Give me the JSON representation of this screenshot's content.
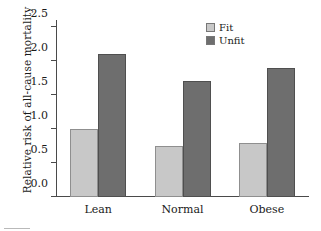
{
  "chart_data": {
    "type": "bar",
    "title": "",
    "xlabel": "",
    "ylabel": "Relative risk of all-cause mortality",
    "categories": [
      "Lean",
      "Normal",
      "Obese"
    ],
    "series": [
      {
        "name": "Fit",
        "color": "#c8c8c8",
        "values": [
          1.0,
          0.75,
          0.8
        ]
      },
      {
        "name": "Unfit",
        "color": "#6e6e6e",
        "values": [
          2.1,
          1.7,
          1.9
        ]
      }
    ],
    "ylim": [
      0.0,
      2.6
    ],
    "yticks": [
      0.0,
      0.5,
      1.0,
      1.5,
      2.0,
      2.5
    ],
    "ytick_labels": [
      "0.0",
      "0.5",
      "1.0",
      "1.5",
      "2.0",
      "2.5"
    ],
    "grid": false,
    "legend_position": "top-right",
    "legend_entries": [
      "Fit",
      "Unfit"
    ]
  }
}
